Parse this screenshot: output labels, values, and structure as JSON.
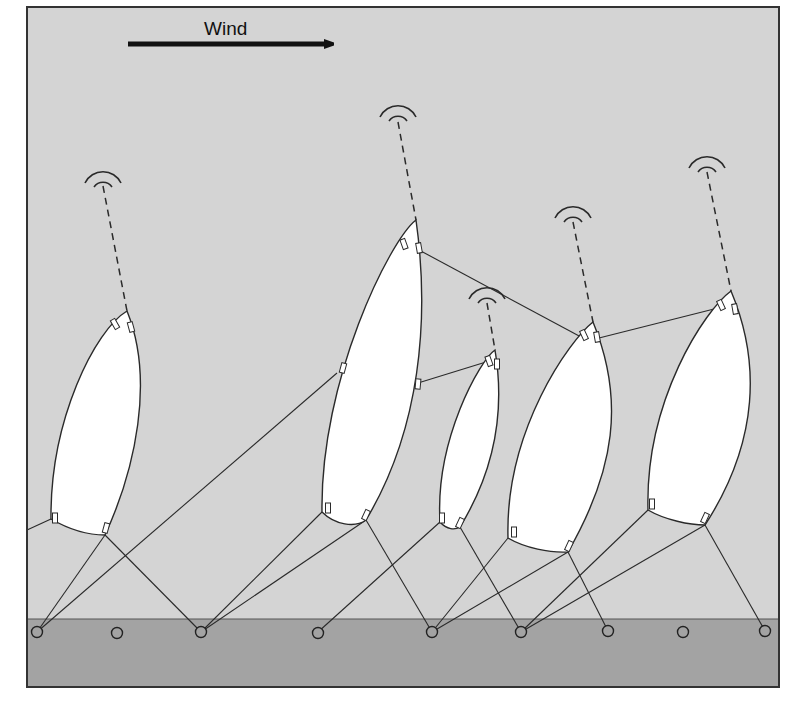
{
  "wind": {
    "label": "Wind",
    "arrow": {
      "x1": 128,
      "y1": 44,
      "x2": 338,
      "y2": 44
    }
  },
  "colors": {
    "sky": "#d4d4d4",
    "ground": "#a3a3a3",
    "sail_fill": "#ffffff",
    "line": "#2a2a2a",
    "frame": "#333333"
  },
  "frame": {
    "x": 27,
    "y": 7,
    "width": 752,
    "height": 680,
    "ground_top": 619
  },
  "anchors": [
    {
      "id": "a1",
      "x": 37,
      "y": 632
    },
    {
      "id": "a2",
      "x": 117,
      "y": 633
    },
    {
      "id": "a3",
      "x": 201,
      "y": 632
    },
    {
      "id": "a4",
      "x": 318,
      "y": 633
    },
    {
      "id": "a5",
      "x": 432,
      "y": 632
    },
    {
      "id": "a6",
      "x": 521,
      "y": 632
    },
    {
      "id": "a7",
      "x": 608,
      "y": 631
    },
    {
      "id": "a8",
      "x": 683,
      "y": 632
    },
    {
      "id": "a9",
      "x": 765,
      "y": 631
    }
  ],
  "sails": [
    {
      "id": "sail-1",
      "path": "M127,311 C95,330 50,420 51,519 C70,530 90,535 105,535 C135,470 155,380 127,311 Z",
      "tether": {
        "x1": 103,
        "y1": 186,
        "x2": 127,
        "y2": 311
      },
      "signal": {
        "cx": 103,
        "cy": 190
      },
      "tabs": [
        [
          115,
          324,
          -30
        ],
        [
          131,
          327,
          -15
        ],
        [
          55,
          518,
          0
        ],
        [
          106,
          528,
          15
        ]
      ]
    },
    {
      "id": "sail-2",
      "path": "M416,220 C390,240 320,380 322,512 C335,525 355,528 366,520 C420,430 430,320 416,220 Z",
      "tether": {
        "x1": 398,
        "y1": 122,
        "x2": 416,
        "y2": 220
      },
      "signal": {
        "cx": 398,
        "cy": 124
      },
      "tabs": [
        [
          404,
          244,
          -20
        ],
        [
          419,
          248,
          -10
        ],
        [
          343,
          368,
          15
        ],
        [
          418,
          384,
          5
        ],
        [
          328,
          508,
          0
        ],
        [
          366,
          515,
          25
        ]
      ]
    },
    {
      "id": "sail-3",
      "path": "M495,350 C480,360 435,440 440,522 C447,530 455,530 460,527 C495,470 505,410 495,350 Z",
      "tether": {
        "x1": 487,
        "y1": 303,
        "x2": 495,
        "y2": 350
      },
      "signal": {
        "cx": 487,
        "cy": 306
      },
      "tabs": [
        [
          489,
          361,
          -20
        ],
        [
          497,
          364,
          0
        ],
        [
          442,
          518,
          0
        ],
        [
          460,
          523,
          25
        ]
      ]
    },
    {
      "id": "sail-4",
      "path": "M593,322 C570,340 505,430 508,538 C525,548 550,553 568,552 C615,470 625,400 593,322 Z",
      "tether": {
        "x1": 573,
        "y1": 222,
        "x2": 593,
        "y2": 322
      },
      "signal": {
        "cx": 573,
        "cy": 225
      },
      "tabs": [
        [
          584,
          335,
          -25
        ],
        [
          597,
          337,
          -10
        ],
        [
          514,
          532,
          0
        ],
        [
          569,
          546,
          25
        ]
      ]
    },
    {
      "id": "sail-5",
      "path": "M731,291 C705,310 645,400 648,510 C665,520 690,525 705,525 C760,440 760,360 731,291 Z",
      "tether": {
        "x1": 707,
        "y1": 172,
        "x2": 731,
        "y2": 291
      },
      "signal": {
        "cx": 707,
        "cy": 175
      },
      "tabs": [
        [
          721,
          305,
          -25
        ],
        [
          735,
          309,
          -10
        ],
        [
          652,
          504,
          0
        ],
        [
          705,
          518,
          25
        ]
      ]
    }
  ],
  "cables": [
    {
      "from": "sail-1 left foot",
      "x1": 51,
      "y1": 519,
      "x2": 27,
      "y2": 530
    },
    {
      "from": "sail-1 right foot",
      "x1": 105,
      "y1": 535,
      "x2": 37,
      "y2": 632
    },
    {
      "from": "sail-1 right foot",
      "x1": 105,
      "y1": 535,
      "x2": 201,
      "y2": 632
    },
    {
      "from": "sail-2 left mid",
      "x1": 337,
      "y1": 373,
      "x2": 37,
      "y2": 632
    },
    {
      "from": "sail-2 left foot",
      "x1": 322,
      "y1": 512,
      "x2": 201,
      "y2": 632
    },
    {
      "from": "sail-2 right foot",
      "x1": 366,
      "y1": 520,
      "x2": 201,
      "y2": 632
    },
    {
      "from": "sail-2 right foot",
      "x1": 366,
      "y1": 520,
      "x2": 432,
      "y2": 632
    },
    {
      "from": "sail-3 left foot",
      "x1": 440,
      "y1": 522,
      "x2": 318,
      "y2": 632
    },
    {
      "from": "sail-3 right foot",
      "x1": 460,
      "y1": 527,
      "x2": 521,
      "y2": 632
    },
    {
      "from": "sail-4 left foot",
      "x1": 508,
      "y1": 538,
      "x2": 432,
      "y2": 632
    },
    {
      "from": "sail-4 right foot",
      "x1": 568,
      "y1": 552,
      "x2": 432,
      "y2": 632
    },
    {
      "from": "sail-4 right foot",
      "x1": 568,
      "y1": 552,
      "x2": 608,
      "y2": 631
    },
    {
      "from": "sail-5 left foot",
      "x1": 648,
      "y1": 510,
      "x2": 521,
      "y2": 632
    },
    {
      "from": "sail-5 right foot",
      "x1": 705,
      "y1": 525,
      "x2": 521,
      "y2": 632
    },
    {
      "from": "sail-5 right foot",
      "x1": 705,
      "y1": 525,
      "x2": 765,
      "y2": 631
    },
    {
      "from": "sail-2 to sail-4 head",
      "x1": 419,
      "y1": 250,
      "x2": 581,
      "y2": 337
    },
    {
      "from": "sail-2 to sail-3 head",
      "x1": 418,
      "y1": 383,
      "x2": 486,
      "y2": 362
    },
    {
      "from": "sail-4 to sail-5 head",
      "x1": 599,
      "y1": 338,
      "x2": 718,
      "y2": 308
    }
  ]
}
